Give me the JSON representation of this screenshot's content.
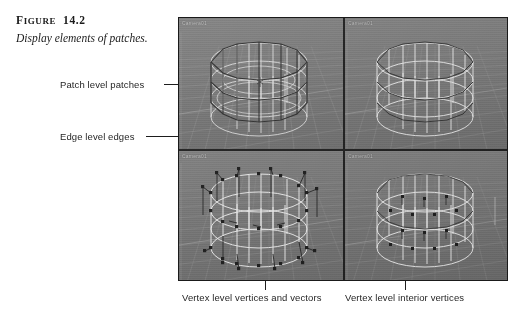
{
  "figure": {
    "label_prefix": "F",
    "label_rest": "IGURE",
    "label_number": "14.2",
    "label_full": "FIGURE  14.2",
    "caption": "Display elements of patches."
  },
  "callouts": [
    {
      "id": "patch-level",
      "text": "Patch level patches"
    },
    {
      "id": "edge-level",
      "text": "Edge level edges"
    },
    {
      "id": "vertex-vectors",
      "text": "Vertex level vertices and vectors"
    },
    {
      "id": "vertex-interior",
      "text": "Vertex level interior vertices"
    }
  ],
  "screenshot": {
    "viewports": [
      {
        "id": "vp-top-left",
        "label": "Camera01",
        "mode": "patch-level",
        "shows": "patch level patches"
      },
      {
        "id": "vp-top-right",
        "label": "Camera01",
        "mode": "edge-level",
        "shows": "edge level edges"
      },
      {
        "id": "vp-bottom-left",
        "label": "Camera01",
        "mode": "vertex-vectors",
        "shows": "vertex level vertices and vectors"
      },
      {
        "id": "vp-bottom-right",
        "label": "Camera01",
        "mode": "vertex-interior",
        "shows": "vertex level interior vertices"
      }
    ]
  },
  "colors": {
    "page_background": "#ffffff",
    "text": "#1b1b1b",
    "leader_line": "#1d1d1d",
    "viewport_background": "#777777",
    "viewport_grid": "#8d8d8d",
    "wireframe_light": "#e8e8e8",
    "wireframe_dark": "#2a2a2a",
    "viewport_label": "#c9c9c9",
    "frame_border": "#1a1a1a"
  }
}
